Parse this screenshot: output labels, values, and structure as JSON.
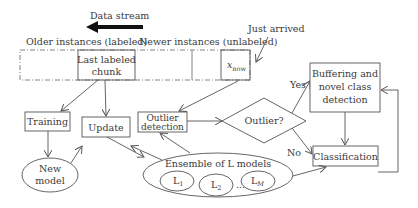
{
  "diagram": {
    "data_stream_label": "Data stream",
    "older_label": "Older instances (labeled)",
    "newer_label": "Newer instances (unlabeled)",
    "just_arrived_label": "Just arrived",
    "last_chunk": {
      "line1": "Last labeled",
      "line2": "chunk"
    },
    "xnow": {
      "base": "x",
      "sub": "now"
    },
    "training": "Training",
    "new_model": {
      "line1": "New",
      "line2": "model"
    },
    "update": "Update",
    "outlier_detection": {
      "line1": "Outlier",
      "line2": "detection"
    },
    "outlier_decision": "Outlier?",
    "yes": "Yes",
    "no": "No",
    "buffering": {
      "line1": "Buffering and",
      "line2": "novel class",
      "line3": "detection"
    },
    "classification": "Classification",
    "ensemble": {
      "label": "Ensemble of L models",
      "models": [
        {
          "base": "L",
          "sub": "1"
        },
        {
          "base": "L",
          "sub": "2"
        },
        {
          "base": "L",
          "sub": "M"
        }
      ],
      "ellipsis": "..."
    },
    "colors": {
      "line": "#555555",
      "text": "#3a3a3a",
      "background": "#ffffff"
    }
  }
}
